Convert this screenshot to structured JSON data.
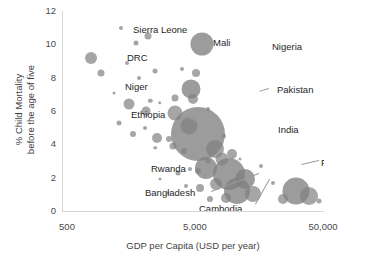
{
  "chart_data": {
    "type": "scatter",
    "title": "",
    "xlabel": "GDP per Capita (USD per year)",
    "ylabel_line1": "% Child Mortality",
    "ylabel_line2": "before the age of five",
    "xscale": "log",
    "xlim": [
      500,
      50000
    ],
    "ylim": [
      0,
      12
    ],
    "xticks": [
      "500",
      "5,000",
      "50,000"
    ],
    "xtick_values": [
      500,
      5000,
      50000
    ],
    "yticks": [
      "0",
      "2",
      "4",
      "6",
      "8",
      "10",
      "12"
    ],
    "ytick_values": [
      0,
      2,
      4,
      6,
      8,
      10,
      12
    ],
    "grid": false,
    "legend": "none",
    "bubble_color": "#808080",
    "size_encodes": "population",
    "points": [
      {
        "label": "Sierra Leone",
        "x": 1300,
        "y": 11.0,
        "r": 2.0
      },
      {
        "label": "",
        "x": 2100,
        "y": 10.5,
        "r": 3.5
      },
      {
        "label": "Mali",
        "x": 1700,
        "y": 10.1,
        "r": 2.5
      },
      {
        "label": "DRC",
        "x": 760,
        "y": 9.2,
        "r": 6.0
      },
      {
        "label": "Nigeria",
        "x": 5600,
        "y": 10.0,
        "r": 11.5
      },
      {
        "label": "",
        "x": 1450,
        "y": 8.9,
        "r": 2.0
      },
      {
        "label": "Niger",
        "x": 900,
        "y": 8.3,
        "r": 3.5
      },
      {
        "label": "",
        "x": 2400,
        "y": 8.4,
        "r": 2.5
      },
      {
        "label": "",
        "x": 3900,
        "y": 8.5,
        "r": 2.0
      },
      {
        "label": "",
        "x": 5000,
        "y": 8.3,
        "r": 4.0
      },
      {
        "label": "",
        "x": 1800,
        "y": 8.0,
        "r": 2.0
      },
      {
        "label": "Pakistan",
        "x": 4600,
        "y": 7.3,
        "r": 9.5
      },
      {
        "label": "",
        "x": 4700,
        "y": 6.7,
        "r": 5.0
      },
      {
        "label": "",
        "x": 1150,
        "y": 7.1,
        "r": 1.5
      },
      {
        "label": "Ethiopia",
        "x": 1500,
        "y": 6.4,
        "r": 5.5
      },
      {
        "label": "",
        "x": 2200,
        "y": 6.6,
        "r": 2.2
      },
      {
        "label": "",
        "x": 2600,
        "y": 6.5,
        "r": 1.8
      },
      {
        "label": "",
        "x": 3400,
        "y": 6.8,
        "r": 3.5
      },
      {
        "label": "",
        "x": 2050,
        "y": 6.0,
        "r": 4.5
      },
      {
        "label": "",
        "x": 3400,
        "y": 5.9,
        "r": 7.5
      },
      {
        "label": "",
        "x": 6200,
        "y": 6.1,
        "r": 2.0
      },
      {
        "label": "India",
        "x": 5200,
        "y": 4.6,
        "r": 27.0
      },
      {
        "label": "",
        "x": 1250,
        "y": 5.3,
        "r": 2.5
      },
      {
        "label": "",
        "x": 2000,
        "y": 5.0,
        "r": 2.0
      },
      {
        "label": "",
        "x": 4400,
        "y": 5.1,
        "r": 8.5
      },
      {
        "label": "",
        "x": 1600,
        "y": 4.6,
        "r": 3.0
      },
      {
        "label": "",
        "x": 2500,
        "y": 4.4,
        "r": 5.0
      },
      {
        "label": "",
        "x": 3100,
        "y": 4.3,
        "r": 3.0
      },
      {
        "label": "",
        "x": 8200,
        "y": 4.5,
        "r": 2.0
      },
      {
        "label": "Rwanda",
        "x": 2400,
        "y": 3.8,
        "r": 1.8
      },
      {
        "label": "",
        "x": 3300,
        "y": 3.9,
        "r": 3.5
      },
      {
        "label": "",
        "x": 4000,
        "y": 3.6,
        "r": 3.0
      },
      {
        "label": "",
        "x": 7000,
        "y": 3.7,
        "r": 9.0
      },
      {
        "label": "",
        "x": 9500,
        "y": 3.4,
        "r": 5.0
      },
      {
        "label": "Philippines",
        "x": 8000,
        "y": 3.1,
        "r": 6.5
      },
      {
        "label": "",
        "x": 6200,
        "y": 3.0,
        "r": 2.5
      },
      {
        "label": "Bangladesh",
        "x": 6000,
        "y": 2.6,
        "r": 11.0
      },
      {
        "label": "Cambodia",
        "x": 5200,
        "y": 2.4,
        "r": 3.0
      },
      {
        "label": "",
        "x": 4500,
        "y": 2.5,
        "r": 2.0
      },
      {
        "label": "",
        "x": 3600,
        "y": 2.3,
        "r": 2.5
      },
      {
        "label": "",
        "x": 9000,
        "y": 2.2,
        "r": 16.0
      },
      {
        "label": "",
        "x": 12000,
        "y": 1.9,
        "r": 10.0
      },
      {
        "label": "",
        "x": 7200,
        "y": 1.6,
        "r": 6.0
      },
      {
        "label": "",
        "x": 5400,
        "y": 1.4,
        "r": 4.0
      },
      {
        "label": "",
        "x": 4200,
        "y": 1.5,
        "r": 2.0
      },
      {
        "label": "",
        "x": 10500,
        "y": 1.2,
        "r": 13.0
      },
      {
        "label": "",
        "x": 14000,
        "y": 1.0,
        "r": 8.0
      },
      {
        "label": "",
        "x": 8600,
        "y": 0.8,
        "r": 5.0
      },
      {
        "label": "",
        "x": 6400,
        "y": 0.7,
        "r": 3.0
      },
      {
        "label": "",
        "x": 30000,
        "y": 1.2,
        "r": 13.5
      },
      {
        "label": "",
        "x": 38000,
        "y": 0.9,
        "r": 9.0
      },
      {
        "label": "",
        "x": 24000,
        "y": 0.7,
        "r": 5.0
      },
      {
        "label": "",
        "x": 46000,
        "y": 0.6,
        "r": 2.5
      },
      {
        "label": "",
        "x": 20000,
        "y": 1.7,
        "r": 2.0
      },
      {
        "label": "",
        "x": 16000,
        "y": 2.7,
        "r": 2.0
      },
      {
        "label": "",
        "x": 11000,
        "y": 3.1,
        "r": 1.5
      },
      {
        "label": "",
        "x": 3000,
        "y": 1.1,
        "r": 1.5
      },
      {
        "label": "",
        "x": 2600,
        "y": 1.9,
        "r": 1.5
      }
    ],
    "annotations": [
      {
        "text": "Sierra Leone",
        "x": 70,
        "y": 13,
        "leader": null
      },
      {
        "text": "Mali",
        "x": 150,
        "y": 26,
        "leader": null
      },
      {
        "text": "Nigeria",
        "x": 209,
        "y": 30,
        "leader": null
      },
      {
        "text": "DRC",
        "x": 64,
        "y": 41,
        "leader": null
      },
      {
        "text": "Niger",
        "x": 62,
        "y": 70,
        "leader": null
      },
      {
        "text": "Pakistan",
        "x": 214,
        "y": 73,
        "leader": {
          "x1": 206,
          "y1": 78,
          "x2": 196,
          "y2": 81
        }
      },
      {
        "text": "Ethiopia",
        "x": 68,
        "y": 98,
        "leader": {
          "x1": 116,
          "y1": 103,
          "x2": 136,
          "y2": 110
        }
      },
      {
        "text": "India",
        "x": 215,
        "y": 113,
        "leader": null
      },
      {
        "text": "Philippines",
        "x": 258,
        "y": 146,
        "leader": {
          "x1": 256,
          "y1": 150,
          "x2": 238,
          "y2": 154
        }
      },
      {
        "text": "Rwanda",
        "x": 88,
        "y": 152,
        "leader": null
      },
      {
        "text": "Bangladesh",
        "x": 82,
        "y": 176,
        "leader": {
          "x1": 148,
          "y1": 180,
          "x2": 196,
          "y2": 162
        }
      },
      {
        "text": "Cambodia",
        "x": 136,
        "y": 192,
        "leader": {
          "x1": 192,
          "y1": 193,
          "x2": 206,
          "y2": 168
        }
      }
    ]
  }
}
